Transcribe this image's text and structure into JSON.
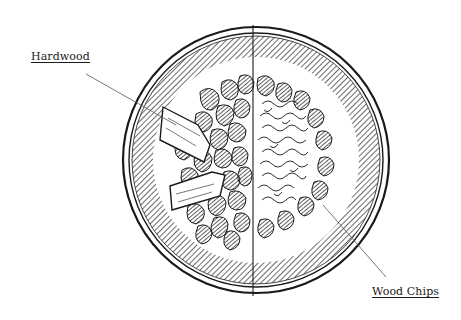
{
  "diagram": {
    "labels": {
      "hardwood": "Hardwood",
      "wood_chips": "Wood Chips"
    },
    "colors": {
      "ink": "#1a1a1a",
      "background": "#ffffff",
      "leader_line": "#555555"
    }
  }
}
